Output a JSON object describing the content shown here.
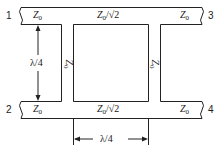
{
  "diagram": {
    "type": "branch-line hybrid coupler (quadrature)",
    "ports": [
      {
        "id": "1",
        "label": "1"
      },
      {
        "id": "2",
        "label": "2"
      },
      {
        "id": "3",
        "label": "3"
      },
      {
        "id": "4",
        "label": "4"
      }
    ],
    "impedances": {
      "port1_line": "Z",
      "port2_line": "Z",
      "port3_line": "Z",
      "port4_line": "Z",
      "sub0": "0",
      "top_series": "Z0/√2",
      "bottom_series": "Z0/√2",
      "left_shunt": "Z",
      "right_shunt": "Z"
    },
    "series_label": {
      "z": "Z",
      "sub": "0",
      "rest": "/√2"
    },
    "dimensions": {
      "vertical": "λ/4",
      "horizontal": "λ/4"
    },
    "colors": {
      "line": "#222222",
      "background": "#ffffff"
    }
  }
}
